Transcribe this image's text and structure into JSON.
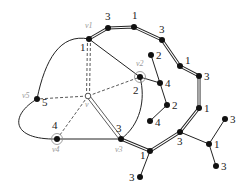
{
  "diagram": {
    "type": "graph",
    "colors": {
      "edge": "#222222",
      "node": "#111111",
      "dashed": "#444444",
      "vertex_label": "#9a9a9a",
      "circle": "#888888"
    },
    "center": {
      "id": "v",
      "label": "v",
      "x": 88,
      "y": 96
    },
    "face_vertices": [
      {
        "id": "v1",
        "label": "v1",
        "weight": "1",
        "x": 89,
        "y": 39,
        "circled": false
      },
      {
        "id": "v2",
        "label": "v2",
        "weight": "2",
        "x": 140,
        "y": 77,
        "circled": true
      },
      {
        "id": "v3",
        "label": "v3",
        "weight": "3",
        "x": 121,
        "y": 139,
        "circled": false
      },
      {
        "id": "v4",
        "label": "v4",
        "weight": "4",
        "x": 57,
        "y": 139,
        "circled": true
      },
      {
        "id": "v5",
        "label": "v5",
        "weight": "5",
        "x": 37,
        "y": 99,
        "circled": false
      }
    ],
    "outer_chain": [
      {
        "weight": "3",
        "x": 108,
        "y": 28
      },
      {
        "weight": "1",
        "x": 134,
        "y": 27
      },
      {
        "weight": "3",
        "x": 162,
        "y": 40
      },
      {
        "weight": "1",
        "x": 180,
        "y": 66
      },
      {
        "weight": "3",
        "x": 199,
        "y": 76
      },
      {
        "weight": "1",
        "x": 199,
        "y": 108
      },
      {
        "weight": "3",
        "x": 180,
        "y": 132
      },
      {
        "weight": "1",
        "x": 150,
        "y": 151
      }
    ],
    "inner_path": [
      {
        "weight": "2",
        "x": 151,
        "y": 55
      },
      {
        "weight": "4",
        "x": 160,
        "y": 83
      },
      {
        "weight": "2",
        "x": 167,
        "y": 105
      },
      {
        "weight": "4",
        "x": 150,
        "y": 121
      }
    ],
    "pendant_nodes": [
      {
        "weight": "3",
        "x": 140,
        "y": 177
      },
      {
        "weight": "1",
        "x": 209,
        "y": 144
      },
      {
        "weight": "3",
        "x": 225,
        "y": 119
      },
      {
        "weight": "3",
        "x": 216,
        "y": 166
      }
    ]
  }
}
